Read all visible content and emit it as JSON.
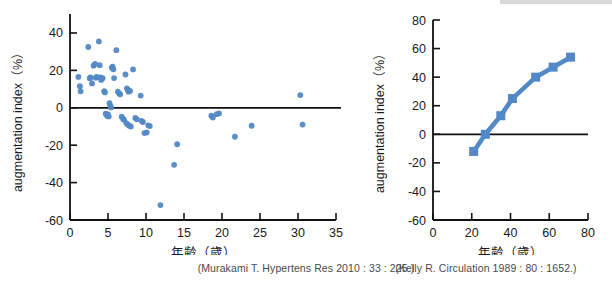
{
  "figure": {
    "accent_color": "#5288c6",
    "axis_color": "#111111",
    "caption_color": "#4a4a4a"
  },
  "panels": [
    {
      "id": "left",
      "caption": "(Murakami T. Hypertens Res 2010 : 33 : 225.)",
      "chart_data": {
        "type": "scatter",
        "title": "",
        "xlabel": "年齢（歳）",
        "ylabel": "augmentation index（%）",
        "xlim": [
          0,
          35
        ],
        "ylim": [
          -60,
          48
        ],
        "xticks": [
          0,
          5,
          10,
          15,
          20,
          25,
          30,
          35
        ],
        "yticks": [
          40,
          20,
          0,
          -20,
          -40,
          -60
        ],
        "xticklabels": [
          "0",
          "5",
          "10",
          "15",
          "20",
          "25",
          "30",
          "35"
        ],
        "yticklabels": [
          "40",
          "20",
          "0",
          "-20",
          "-40",
          "-60"
        ],
        "grid": false,
        "legend": "none",
        "zero_reference_line": 0,
        "marker": "circle",
        "series": [
          {
            "name": "augmentation index vs age",
            "points": [
              [
                1.1,
                16.5
              ],
              [
                1.3,
                11.5
              ],
              [
                1.4,
                8.8
              ],
              [
                2.4,
                32.5
              ],
              [
                2.6,
                15.8
              ],
              [
                2.7,
                16.2
              ],
              [
                2.9,
                13.0
              ],
              [
                3.1,
                22.5
              ],
              [
                3.3,
                23.5
              ],
              [
                3.4,
                16.0
              ],
              [
                3.5,
                16.5
              ],
              [
                3.8,
                35.5
              ],
              [
                3.9,
                22.8
              ],
              [
                4.0,
                16.2
              ],
              [
                4.1,
                14.9
              ],
              [
                4.3,
                15.8
              ],
              [
                4.5,
                8.9
              ],
              [
                4.6,
                8.2
              ],
              [
                4.7,
                -3.2
              ],
              [
                4.9,
                -4.4
              ],
              [
                5.0,
                -3.6
              ],
              [
                5.1,
                -4.6
              ],
              [
                5.2,
                2.5
              ],
              [
                5.3,
                1.2
              ],
              [
                5.4,
                0.2
              ],
              [
                5.5,
                21.5
              ],
              [
                5.6,
                22.0
              ],
              [
                5.7,
                20.6
              ],
              [
                5.8,
                15.9
              ],
              [
                6.1,
                30.8
              ],
              [
                6.3,
                8.6
              ],
              [
                6.5,
                7.6
              ],
              [
                6.6,
                7.2
              ],
              [
                6.8,
                -4.8
              ],
              [
                7.0,
                -6.0
              ],
              [
                7.1,
                -6.4
              ],
              [
                7.3,
                17.8
              ],
              [
                7.5,
                10.4
              ],
              [
                7.6,
                9.6
              ],
              [
                7.7,
                8.6
              ],
              [
                7.9,
                9.0
              ],
              [
                7.4,
                -8.2
              ],
              [
                7.6,
                -9.0
              ],
              [
                7.8,
                -9.6
              ],
              [
                8.0,
                -10.0
              ],
              [
                8.3,
                20.5
              ],
              [
                8.6,
                -5.4
              ],
              [
                8.8,
                -6.2
              ],
              [
                9.3,
                6.5
              ],
              [
                9.4,
                -7.0
              ],
              [
                9.6,
                -7.6
              ],
              [
                9.8,
                -13.5
              ],
              [
                10.1,
                -13.2
              ],
              [
                10.3,
                -9.4
              ],
              [
                10.5,
                -9.8
              ],
              [
                11.9,
                -52.0
              ],
              [
                13.7,
                -30.5
              ],
              [
                14.1,
                -19.5
              ],
              [
                18.6,
                -4.2
              ],
              [
                18.8,
                -5.2
              ],
              [
                19.3,
                -3.4
              ],
              [
                19.6,
                -3.0
              ],
              [
                21.7,
                -15.5
              ],
              [
                23.9,
                -9.6
              ],
              [
                30.3,
                6.8
              ],
              [
                30.6,
                -9.0
              ]
            ]
          }
        ]
      }
    },
    {
      "id": "right",
      "caption": "(Kelly R. Circulation 1989 : 80 : 1652.)",
      "chart_data": {
        "type": "line",
        "title": "",
        "xlabel": "年齢（歳）",
        "ylabel": "augmentation index（%）",
        "xlim": [
          0,
          80
        ],
        "ylim": [
          -60,
          80
        ],
        "xticks": [
          0,
          20,
          40,
          60,
          80
        ],
        "yticks": [
          80,
          60,
          40,
          20,
          0,
          -20,
          -40,
          -60
        ],
        "xticklabels": [
          "0",
          "20",
          "40",
          "60",
          "80"
        ],
        "yticklabels": [
          "80",
          "60",
          "40",
          "20",
          "0",
          "-20",
          "-40",
          "-60"
        ],
        "grid": false,
        "legend": "none",
        "zero_reference_line": 0,
        "marker": "square",
        "series": [
          {
            "name": "augmentation index vs age",
            "x": [
              21,
              27,
              35,
              41,
              53,
              62,
              71
            ],
            "y": [
              -12,
              0,
              13,
              25,
              40,
              47,
              54
            ]
          }
        ]
      }
    }
  ]
}
